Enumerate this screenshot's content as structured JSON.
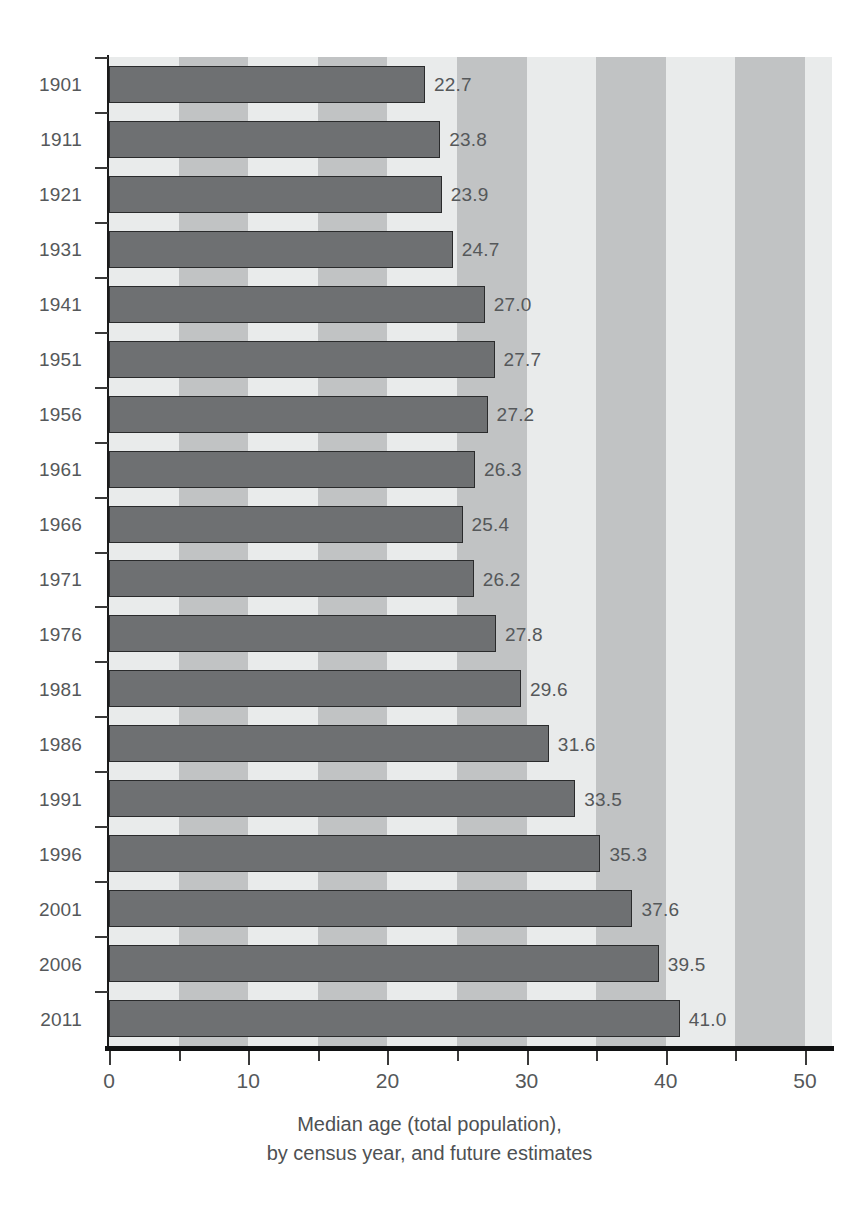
{
  "chart_data": {
    "type": "bar",
    "orientation": "horizontal",
    "title": "",
    "caption_line1": "Median age (total population),",
    "caption_line2": "by census year, and future estimates",
    "xlabel": "",
    "ylabel": "",
    "categories": [
      "1901",
      "1911",
      "1921",
      "1931",
      "1941",
      "1951",
      "1956",
      "1961",
      "1966",
      "1971",
      "1976",
      "1981",
      "1986",
      "1991",
      "1996",
      "2001",
      "2006",
      "2011"
    ],
    "values": [
      22.7,
      23.8,
      23.9,
      24.7,
      27.0,
      27.7,
      27.2,
      26.3,
      25.4,
      26.2,
      27.8,
      29.6,
      31.6,
      33.5,
      35.3,
      37.6,
      39.5,
      41.0
    ],
    "value_labels": [
      "22.7",
      "23.8",
      "23.9",
      "24.7",
      "27.0",
      "27.7",
      "27.2",
      "26.3",
      "25.4",
      "26.2",
      "27.8",
      "29.6",
      "31.6",
      "33.5",
      "35.3",
      "37.6",
      "39.5",
      "41.0"
    ],
    "xlim": [
      0,
      50
    ],
    "xticks": [
      0,
      10,
      20,
      30,
      40,
      50
    ],
    "xtick_labels": [
      "0",
      "10",
      "20",
      "30",
      "40",
      "50"
    ],
    "xticks_minor": [
      5,
      15,
      25,
      35,
      45
    ],
    "grid": false,
    "legend": null,
    "background_bands": {
      "interval": 5,
      "light": "#e9ebeb",
      "medium": "#c1c3c4"
    },
    "colors": {
      "bar_fill": "#6e7072",
      "bar_edge": "#2a2b2c",
      "text": "#55585a",
      "axis": "#111213"
    }
  }
}
